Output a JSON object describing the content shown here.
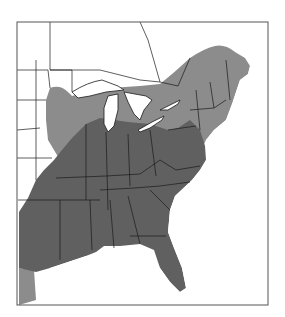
{
  "map": {
    "type": "range-map",
    "region": "Eastern United States and southeastern Canada",
    "colors": {
      "background": "#ffffff",
      "frame": "#555555",
      "border": "#1a1a1a",
      "water": "#ffffff",
      "range_core": "#606060",
      "range_peripheral": "#8c8c8c",
      "outside_range": "#ffffff"
    },
    "legend": null,
    "labels": []
  }
}
